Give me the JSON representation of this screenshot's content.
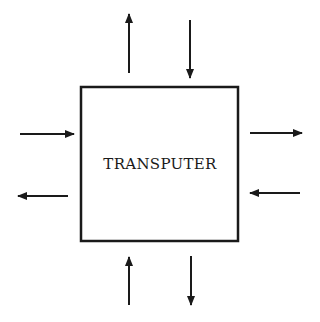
{
  "diagram": {
    "block": {
      "label": "TRANSPUTER"
    },
    "links": [
      {
        "side": "top",
        "direction": "out"
      },
      {
        "side": "top",
        "direction": "in"
      },
      {
        "side": "left",
        "direction": "in"
      },
      {
        "side": "left",
        "direction": "out"
      },
      {
        "side": "right",
        "direction": "out"
      },
      {
        "side": "right",
        "direction": "in"
      },
      {
        "side": "bottom",
        "direction": "in"
      },
      {
        "side": "bottom",
        "direction": "out"
      }
    ],
    "colors": {
      "stroke": "#1a1a1a",
      "background": "#ffffff"
    }
  }
}
